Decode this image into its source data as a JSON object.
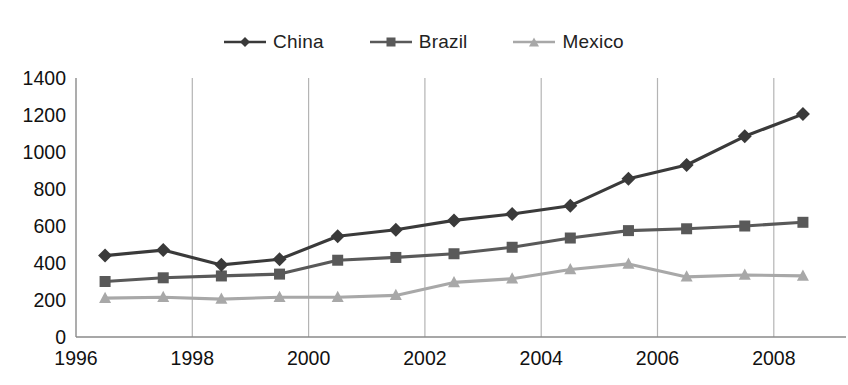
{
  "top_cut_text": "",
  "legend": {
    "position": "top-center",
    "entries": [
      {
        "label": "China",
        "marker": "diamond",
        "color": "#3a3a3a"
      },
      {
        "label": "Brazil",
        "marker": "square",
        "color": "#595959"
      },
      {
        "label": "Mexico",
        "marker": "triangle",
        "color": "#a8a8a8"
      }
    ]
  },
  "colors": {
    "china": "#3a3a3a",
    "brazil": "#595959",
    "mexico": "#a8a8a8",
    "axis": "#8a8a8a",
    "gridline": "#b4b4b4",
    "text": "#111111",
    "background": "#ffffff"
  },
  "chart_data": {
    "type": "line",
    "title": "",
    "subtitle": "",
    "xlabel": "",
    "ylabel": "",
    "xlim": [
      1996,
      2009
    ],
    "ylim": [
      0,
      1400
    ],
    "ytick_step": 200,
    "yticks": [
      0,
      200,
      400,
      600,
      800,
      1000,
      1200,
      1400
    ],
    "xticks": [
      1996,
      1998,
      2000,
      2002,
      2004,
      2006,
      2008
    ],
    "xtick_labels": [
      "1996",
      "1998",
      "2000",
      "2002",
      "2004",
      "2006",
      "2008"
    ],
    "grid": {
      "vertical": true,
      "horizontal": false
    },
    "legend_position": "top-center",
    "x": [
      1996.5,
      1997.5,
      1998.5,
      1999.5,
      2000.5,
      2001.5,
      2002.5,
      2003.5,
      2004.5,
      2005.5,
      2006.5,
      2007.5,
      2008.5
    ],
    "series": [
      {
        "name": "China",
        "marker": "diamond",
        "color": "#3a3a3a",
        "values": [
          440,
          470,
          390,
          420,
          545,
          580,
          630,
          665,
          710,
          855,
          930,
          1085,
          1205
        ]
      },
      {
        "name": "Brazil",
        "marker": "square",
        "color": "#595959",
        "values": [
          300,
          320,
          330,
          340,
          415,
          430,
          450,
          485,
          535,
          575,
          585,
          600,
          620
        ]
      },
      {
        "name": "Mexico",
        "marker": "triangle",
        "color": "#a8a8a8",
        "values": [
          210,
          215,
          205,
          215,
          215,
          225,
          295,
          315,
          365,
          395,
          325,
          335,
          330
        ]
      }
    ]
  }
}
